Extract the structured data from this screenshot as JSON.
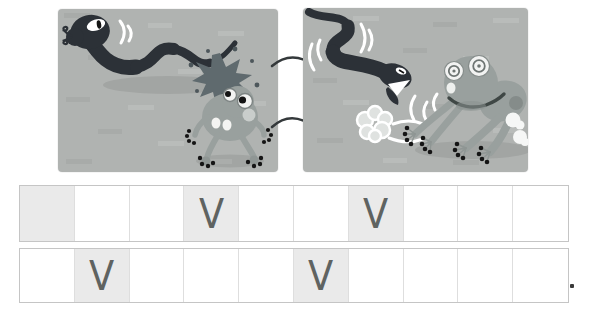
{
  "colors": {
    "page_bg": "#ffffff",
    "panel_bg": "#b0b3b1",
    "snake": "#2c3137",
    "frog": "#99a09e",
    "frog_light": "#c9cdcb",
    "burst": "#5f6a6e",
    "shaded_cell": "#eaeaea",
    "cell_border": "#c5c5c5",
    "mark_color": "#5f6361",
    "motion_line": "#ffffff",
    "toe_dot": "#151515"
  },
  "comic": {
    "panel1_alt": "snake-sneaks-up-on-startled-frog",
    "panel2_alt": "snake-chases-frog-running-away"
  },
  "answer_grid": {
    "mark_glyph": "V",
    "period": "",
    "rows": [
      {
        "cells": [
          {
            "shaded": true,
            "mark": ""
          },
          {
            "shaded": false,
            "mark": ""
          },
          {
            "shaded": false,
            "mark": ""
          },
          {
            "shaded": true,
            "mark": "V"
          },
          {
            "shaded": false,
            "mark": ""
          },
          {
            "shaded": false,
            "mark": ""
          },
          {
            "shaded": true,
            "mark": "V"
          },
          {
            "shaded": false,
            "mark": ""
          },
          {
            "shaded": false,
            "mark": ""
          },
          {
            "shaded": false,
            "mark": ""
          }
        ]
      },
      {
        "cells": [
          {
            "shaded": false,
            "mark": ""
          },
          {
            "shaded": true,
            "mark": "V"
          },
          {
            "shaded": false,
            "mark": ""
          },
          {
            "shaded": false,
            "mark": ""
          },
          {
            "shaded": false,
            "mark": ""
          },
          {
            "shaded": true,
            "mark": "V"
          },
          {
            "shaded": false,
            "mark": ""
          },
          {
            "shaded": false,
            "mark": ""
          },
          {
            "shaded": false,
            "mark": ""
          },
          {
            "shaded": false,
            "mark": ""
          }
        ]
      }
    ]
  }
}
